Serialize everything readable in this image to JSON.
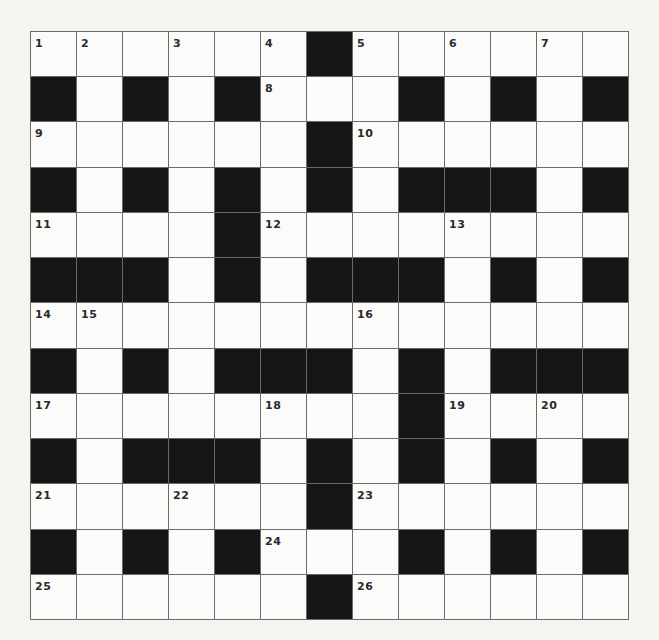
{
  "puzzle": {
    "rows": 13,
    "cols": 13,
    "colors": {
      "black": "#161616",
      "white": "#fbfbf9",
      "line": "#6a6a6a",
      "number": "#2a2a2a"
    },
    "layout": [
      "WWWWWWBWWWWWW",
      "BWBWBWWWBWBWB",
      "WWWWWWBWWWWWW",
      "BWBWBWBWBBBWB",
      "WWWWBWWWWWWWW",
      "BBBWBWBBBWBWB",
      "WWWWWWWWWWWWW",
      "BWBWBBBWBWBBB",
      "WWWWWWWWBWWWW",
      "BWBBBWBWBWBWB",
      "WWWWWWBWWWWWW",
      "BWBWBWWWBWBWB",
      "WWWWWWBWWWWWW"
    ],
    "numbers": [
      {
        "row": 0,
        "col": 0,
        "n": "1"
      },
      {
        "row": 0,
        "col": 1,
        "n": "2"
      },
      {
        "row": 0,
        "col": 3,
        "n": "3"
      },
      {
        "row": 0,
        "col": 5,
        "n": "4"
      },
      {
        "row": 0,
        "col": 7,
        "n": "5"
      },
      {
        "row": 0,
        "col": 9,
        "n": "6"
      },
      {
        "row": 0,
        "col": 11,
        "n": "7"
      },
      {
        "row": 1,
        "col": 5,
        "n": "8"
      },
      {
        "row": 2,
        "col": 0,
        "n": "9"
      },
      {
        "row": 2,
        "col": 7,
        "n": "10"
      },
      {
        "row": 4,
        "col": 0,
        "n": "11"
      },
      {
        "row": 4,
        "col": 5,
        "n": "12"
      },
      {
        "row": 4,
        "col": 9,
        "n": "13"
      },
      {
        "row": 6,
        "col": 0,
        "n": "14"
      },
      {
        "row": 6,
        "col": 1,
        "n": "15"
      },
      {
        "row": 6,
        "col": 7,
        "n": "16"
      },
      {
        "row": 8,
        "col": 0,
        "n": "17"
      },
      {
        "row": 8,
        "col": 5,
        "n": "18"
      },
      {
        "row": 8,
        "col": 9,
        "n": "19"
      },
      {
        "row": 8,
        "col": 11,
        "n": "20"
      },
      {
        "row": 10,
        "col": 0,
        "n": "21"
      },
      {
        "row": 10,
        "col": 3,
        "n": "22"
      },
      {
        "row": 10,
        "col": 7,
        "n": "23"
      },
      {
        "row": 11,
        "col": 5,
        "n": "24"
      },
      {
        "row": 12,
        "col": 0,
        "n": "25"
      },
      {
        "row": 12,
        "col": 7,
        "n": "26"
      }
    ]
  }
}
